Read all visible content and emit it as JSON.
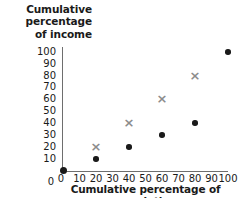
{
  "chart_data": {
    "type": "scatter",
    "title": "",
    "xlabel": "Cumulative percentage of population",
    "ylabel": "Cumulative percentage of income",
    "xlim": [
      0,
      100
    ],
    "ylim": [
      0,
      100
    ],
    "xticks": [
      "0",
      "10",
      "20",
      "30",
      "40",
      "50",
      "60",
      "70",
      "80",
      "90",
      "100"
    ],
    "yticks": [
      "100",
      "90",
      "80",
      "70",
      "60",
      "50",
      "40",
      "30",
      "20",
      "10",
      "0"
    ],
    "grid": false,
    "legend": "none",
    "series": [
      {
        "name": "black-dot-series",
        "marker": "circle",
        "color": "#1a1a1a",
        "points": [
          {
            "x": 0,
            "y": 0
          },
          {
            "x": 20,
            "y": 10
          },
          {
            "x": 40,
            "y": 20
          },
          {
            "x": 60,
            "y": 30
          },
          {
            "x": 80,
            "y": 40
          },
          {
            "x": 100,
            "y": 100
          }
        ]
      },
      {
        "name": "gray-cross-series",
        "marker": "cross",
        "color": "#8c8c8c",
        "glyph": "×",
        "points": [
          {
            "x": 20,
            "y": 20
          },
          {
            "x": 40,
            "y": 40
          },
          {
            "x": 60,
            "y": 60
          },
          {
            "x": 80,
            "y": 80
          }
        ]
      }
    ]
  },
  "axis": {
    "ylabel_line1": "Cumulative",
    "ylabel_line2": "percentage",
    "ylabel_line3": "of income",
    "xlabel": "Cumulative percentage of population"
  }
}
